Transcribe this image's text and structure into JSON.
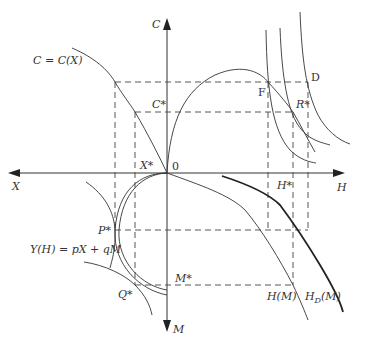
{
  "diagram": {
    "type": "four-quadrant economics diagram",
    "axes": {
      "up": "C",
      "left": "X",
      "right": "H",
      "down": "M",
      "origin": "0"
    },
    "curve_labels": {
      "consumption": "C = C(X)",
      "income": "Y(H) = pX + qM",
      "h_of_m": "H(M)",
      "hd_of_m": "H",
      "hd_sub": "D",
      "hd_suffix": "(M)"
    },
    "point_labels": {
      "c_star": "C*",
      "x_star": "X*",
      "h_star": "H*",
      "m_star": "M*",
      "p_star": "P*",
      "q_star": "Q*",
      "r_star": "R*",
      "f": "F",
      "d": "D"
    }
  }
}
